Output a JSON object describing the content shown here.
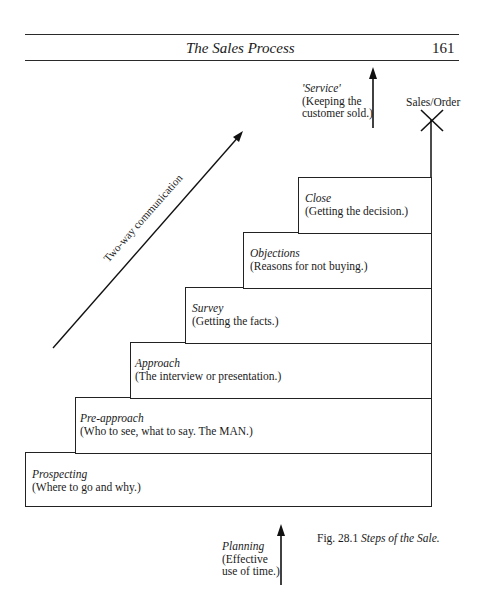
{
  "header": {
    "running_title": "The Sales Process",
    "page_number": "161"
  },
  "figure": {
    "caption_number": "Fig. 28.1",
    "caption_title": "Steps of the Sale.",
    "diagonal_arrow_label": "Two-way communication",
    "top_marker": "Sales/Order",
    "service": {
      "name": "'Service'",
      "desc_line1": "(Keeping the",
      "desc_line2": "customer sold.)"
    },
    "planning": {
      "name": "Planning",
      "desc_line1": "(Effective",
      "desc_line2": "use of time.)"
    },
    "steps": [
      {
        "name": "Prospecting",
        "desc": "(Where to go and why.)"
      },
      {
        "name": "Pre-approach",
        "desc": "(Who to see, what to say. The MAN.)"
      },
      {
        "name": "Approach",
        "desc": "(The interview or presentation.)"
      },
      {
        "name": "Survey",
        "desc": "(Getting the facts.)"
      },
      {
        "name": "Objections",
        "desc": "(Reasons for not buying.)"
      },
      {
        "name": "Close",
        "desc": "(Getting the decision.)"
      }
    ]
  }
}
